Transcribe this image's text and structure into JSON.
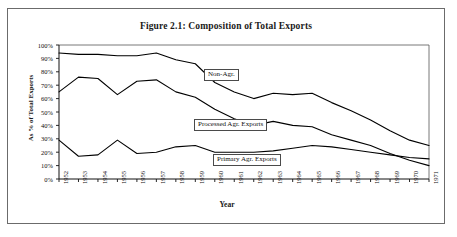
{
  "figure": {
    "title": "Figure 2.1:  Composition of Total Exports",
    "border_color": "#6b6b6b",
    "line_color": "#000000",
    "background": "#ffffff"
  },
  "chart_data": {
    "type": "line",
    "title": "Figure 2.1:  Composition of Total Exports",
    "xlabel": "Year",
    "ylabel": "As % of Total Exports",
    "ylim": [
      0,
      100
    ],
    "ytick_labels": [
      "0%",
      "10%",
      "20%",
      "30%",
      "40%",
      "50%",
      "60%",
      "70%",
      "80%",
      "90%",
      "100%"
    ],
    "yticks": [
      0,
      10,
      20,
      30,
      40,
      50,
      60,
      70,
      80,
      90,
      100
    ],
    "grid": false,
    "legend_position": "inline-annotations",
    "categories": [
      "1952",
      "1953",
      "1954",
      "1955",
      "1956",
      "1957",
      "1958",
      "1959",
      "1960",
      "1961",
      "1962",
      "1963",
      "1964",
      "1965",
      "1966",
      "1967",
      "1968",
      "1969",
      "1970",
      "1971"
    ],
    "x": [
      1952,
      1953,
      1954,
      1955,
      1956,
      1957,
      1958,
      1959,
      1960,
      1961,
      1962,
      1963,
      1964,
      1965,
      1966,
      1967,
      1968,
      1969,
      1970,
      1971
    ],
    "series": [
      {
        "name": "Primary Agr. Exports",
        "label": "Primary Agr. Exports",
        "values": [
          29,
          17,
          18,
          29,
          19,
          20,
          24,
          25,
          20,
          20,
          20,
          21,
          23,
          25,
          24,
          22,
          20,
          18,
          16,
          15
        ]
      },
      {
        "name": "Processed Agr. Exports",
        "label": "Processed Agr. Exports",
        "values": [
          65,
          76,
          75,
          63,
          73,
          74,
          65,
          61,
          52,
          45,
          40,
          43,
          40,
          39,
          33,
          29,
          25,
          19,
          14,
          10
        ]
      },
      {
        "name": "Non-Agr.",
        "label": "Non-Agr.",
        "values": [
          94,
          93,
          93,
          92,
          92,
          94,
          89,
          86,
          72,
          65,
          60,
          64,
          63,
          64,
          57,
          51,
          44,
          36,
          29,
          25
        ]
      }
    ],
    "annotations": [
      {
        "text": "Non-Agr.",
        "boxed": true
      },
      {
        "text": "Processed Agr. Exports",
        "boxed": true
      },
      {
        "text": "Primary Agr. Exports",
        "boxed": true
      }
    ]
  }
}
